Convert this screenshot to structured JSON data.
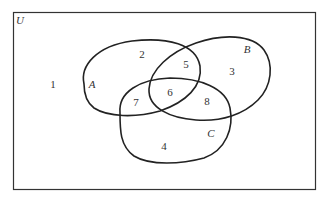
{
  "diagram": {
    "type": "venn",
    "universe": {
      "label": "U"
    },
    "sets": [
      {
        "name": "A"
      },
      {
        "name": "B"
      },
      {
        "name": "C"
      }
    ],
    "regions": [
      {
        "id": "1",
        "label": "1",
        "description": "outside A, B, C"
      },
      {
        "id": "2",
        "label": "2",
        "description": "A only"
      },
      {
        "id": "3",
        "label": "3",
        "description": "B only"
      },
      {
        "id": "4",
        "label": "4",
        "description": "C only"
      },
      {
        "id": "5",
        "label": "5",
        "description": "A and B only"
      },
      {
        "id": "6",
        "label": "6",
        "description": "A, B and C"
      },
      {
        "id": "7",
        "label": "7",
        "description": "A and C only"
      },
      {
        "id": "8",
        "label": "8",
        "description": "B and C only"
      }
    ],
    "stroke_color": "#222222",
    "background_color": "#ffffff"
  }
}
